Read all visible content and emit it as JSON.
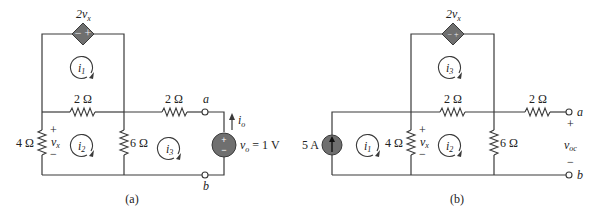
{
  "figure_a": {
    "caption": "(a)",
    "dependent_source": {
      "label": "2v",
      "label_sub": "x",
      "signs": "− +"
    },
    "resistors": [
      {
        "id": "r_top_mid",
        "label": "2 Ω"
      },
      {
        "id": "r_top_right",
        "label": "2 Ω"
      },
      {
        "id": "r_left",
        "label": "4 Ω"
      },
      {
        "id": "r_mid",
        "label": "6 Ω"
      }
    ],
    "vx": {
      "plus": "+",
      "label": "v",
      "sub": "x",
      "minus": "−"
    },
    "mesh_currents": [
      {
        "label": "i",
        "sub": "1"
      },
      {
        "label": "i",
        "sub": "2"
      },
      {
        "label": "i",
        "sub": "3"
      }
    ],
    "terminals": {
      "a": "a",
      "b": "b"
    },
    "voltage_source": {
      "label": "v",
      "sub": "o",
      "value": " = 1 V",
      "plus": "+",
      "minus": "−"
    },
    "current_label": {
      "label": "i",
      "sub": "o"
    }
  },
  "figure_b": {
    "caption": "(b)",
    "dependent_source": {
      "label": "2v",
      "label_sub": "x",
      "signs": "− +"
    },
    "current_source": {
      "label": "5 A"
    },
    "resistors": [
      {
        "id": "r_top_mid",
        "label": "2 Ω"
      },
      {
        "id": "r_top_right",
        "label": "2 Ω"
      },
      {
        "id": "r_left",
        "label": "4 Ω"
      },
      {
        "id": "r_right",
        "label": "6 Ω"
      }
    ],
    "vx": {
      "plus": "+",
      "label": "v",
      "sub": "x",
      "minus": "−"
    },
    "mesh_currents": [
      {
        "label": "i",
        "sub": "1"
      },
      {
        "label": "i",
        "sub": "2"
      },
      {
        "label": "i",
        "sub": "3"
      }
    ],
    "terminals": {
      "a": "a",
      "b": "b"
    },
    "voc": {
      "plus": "+",
      "label": "v",
      "sub": "oc",
      "minus": "−"
    }
  }
}
